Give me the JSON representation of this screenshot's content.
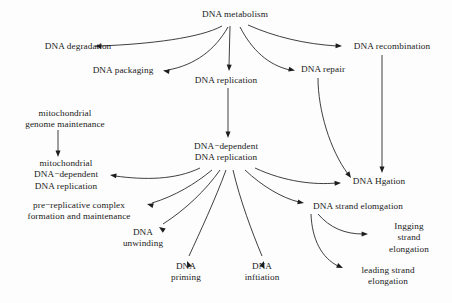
{
  "figure": {
    "kind": "directed-acyclic-graph",
    "width": 452,
    "height": 303,
    "background_color": "#fdfdfd",
    "line_color": "#1d1d1d",
    "text_color": "#1a1a1a"
  },
  "nodes": [
    {
      "id": "dna_metabolism",
      "label": "DNA metabolism",
      "x": 235,
      "y": 15,
      "lines": 1
    },
    {
      "id": "dna_degradation",
      "label": "DNA degradation",
      "x": 78,
      "y": 47,
      "lines": 1
    },
    {
      "id": "dna_recombination",
      "label": "DNA recombination",
      "x": 392,
      "y": 47,
      "lines": 1
    },
    {
      "id": "dna_packaging",
      "label": "DNA packaging",
      "x": 123,
      "y": 71,
      "lines": 1
    },
    {
      "id": "dna_replication",
      "label": "DNA replication",
      "x": 226,
      "y": 81,
      "lines": 1
    },
    {
      "id": "dna_repair",
      "label": "DNA repair",
      "x": 323,
      "y": 70,
      "lines": 1
    },
    {
      "id": "mito_genome_maint",
      "label": "mitochondrial\ngenome maintenance",
      "x": 65,
      "y": 119,
      "lines": 2
    },
    {
      "id": "dna_dep_replication",
      "label": "DNA−dependent\nDNA replication",
      "x": 226,
      "y": 152,
      "lines": 2
    },
    {
      "id": "mito_dna_dep_repl",
      "label": "mitochondrial\nDNA−dependent\nDNA replication",
      "x": 66,
      "y": 175,
      "lines": 3
    },
    {
      "id": "dna_ligation",
      "label": "DNA Hgation",
      "x": 379,
      "y": 182,
      "lines": 1
    },
    {
      "id": "pre_replicative",
      "label": "pre−replicative complex\nformation and maintenance",
      "x": 79,
      "y": 211,
      "lines": 2
    },
    {
      "id": "dna_strand_elong",
      "label": "DNA strand elomgation",
      "x": 358,
      "y": 207,
      "lines": 1
    },
    {
      "id": "dna_unwinding",
      "label": "DNA\nunwinding",
      "x": 143,
      "y": 238,
      "lines": 2
    },
    {
      "id": "lagging_strand",
      "label": "Ingging strand\nelongation",
      "x": 409,
      "y": 238,
      "lines": 2
    },
    {
      "id": "dna_priming",
      "label": "DNA\npriming",
      "x": 186,
      "y": 272,
      "lines": 2
    },
    {
      "id": "dna_initiation",
      "label": "DNA\ninftiation",
      "x": 262,
      "y": 272,
      "lines": 2
    },
    {
      "id": "leading_strand",
      "label": "leading strand\nelongation",
      "x": 388,
      "y": 276,
      "lines": 2
    }
  ],
  "edges": [
    {
      "id": "e1",
      "from": "dna_metabolism",
      "to": "dna_degradation",
      "path": "M 222 26 C 200 38, 150 44, 100 46",
      "arrow_at": [
        95,
        46
      ],
      "arrow_angle": 182
    },
    {
      "id": "e2",
      "from": "dna_metabolism",
      "to": "dna_packaging",
      "path": "M 228 27 C 215 50, 195 65, 168 70",
      "arrow_at": [
        163,
        70.5
      ],
      "arrow_angle": 190
    },
    {
      "id": "e3",
      "from": "dna_metabolism",
      "to": "dna_replication",
      "path": "M 230 26 L 229 66",
      "arrow_at": [
        229,
        71
      ],
      "arrow_angle": 92
    },
    {
      "id": "e4",
      "from": "dna_metabolism",
      "to": "dna_repair",
      "path": "M 240 27 C 252 50, 268 65, 290 70",
      "arrow_at": [
        295,
        70.5
      ],
      "arrow_angle": 12
    },
    {
      "id": "e5",
      "from": "dna_metabolism",
      "to": "dna_recombination",
      "path": "M 248 25 C 275 37, 305 44, 337 46",
      "arrow_at": [
        342,
        46
      ],
      "arrow_angle": 2
    },
    {
      "id": "e6",
      "from": "dna_replication",
      "to": "dna_dep_replication",
      "path": "M 228 88 L 228 133",
      "arrow_at": [
        228,
        138
      ],
      "arrow_angle": 90
    },
    {
      "id": "e7",
      "from": "mito_genome_maint",
      "to": "mito_dna_dep_repl",
      "path": "M 58 130 L 58 152",
      "arrow_at": [
        58,
        157
      ],
      "arrow_angle": 90
    },
    {
      "id": "e8",
      "from": "dna_repair",
      "to": "dna_ligation",
      "path": "M 318 78 C 318 110, 330 150, 348 174",
      "arrow_at": [
        351,
        178
      ],
      "arrow_angle": 55
    },
    {
      "id": "e9",
      "from": "dna_recombination",
      "to": "dna_ligation",
      "path": "M 382 55 L 382 168",
      "arrow_at": [
        382,
        173
      ],
      "arrow_angle": 90
    },
    {
      "id": "e10",
      "from": "dna_dep_replication",
      "to": "mito_dna_dep_repl",
      "path": "M 200 168 C 175 180, 145 180, 115 176",
      "arrow_at": [
        110,
        175
      ],
      "arrow_angle": 188
    },
    {
      "id": "e11",
      "from": "dna_dep_replication",
      "to": "pre_replicative",
      "path": "M 212 170 C 195 184, 175 196, 152 203",
      "arrow_at": [
        147,
        204
      ],
      "arrow_angle": 195
    },
    {
      "id": "e12",
      "from": "dna_dep_replication",
      "to": "dna_unwinding",
      "path": "M 220 170 C 206 190, 185 210, 163 224",
      "arrow_at": [
        159,
        227
      ],
      "arrow_angle": 215
    },
    {
      "id": "e13",
      "from": "dna_dep_replication",
      "to": "dna_priming",
      "path": "M 226 170 C 215 200, 200 232, 189 256",
      "arrow_at": [
        187,
        261
      ],
      "arrow_angle": 247
    },
    {
      "id": "e14",
      "from": "dna_dep_replication",
      "to": "dna_initiation",
      "path": "M 233 170 C 240 200, 252 232, 262 256",
      "arrow_at": [
        264,
        261
      ],
      "arrow_angle": 290
    },
    {
      "id": "e15",
      "from": "dna_dep_replication",
      "to": "dna_strand_elong",
      "path": "M 245 170 C 262 186, 282 198, 299 202",
      "arrow_at": [
        304,
        203
      ],
      "arrow_angle": 10
    },
    {
      "id": "e16",
      "from": "dna_dep_replication",
      "to": "dna_ligation",
      "path": "M 255 168 C 285 182, 315 185, 336 183",
      "arrow_at": [
        341,
        183
      ],
      "arrow_angle": 357
    },
    {
      "id": "e17",
      "from": "dna_strand_elong",
      "to": "lagging_strand",
      "path": "M 318 214 C 330 228, 345 234, 363 234",
      "arrow_at": [
        368,
        234
      ],
      "arrow_angle": 0
    },
    {
      "id": "e18",
      "from": "dna_strand_elong",
      "to": "leading_strand",
      "path": "M 311 214 C 312 240, 322 258, 338 266",
      "arrow_at": [
        343,
        268
      ],
      "arrow_angle": 24
    }
  ]
}
